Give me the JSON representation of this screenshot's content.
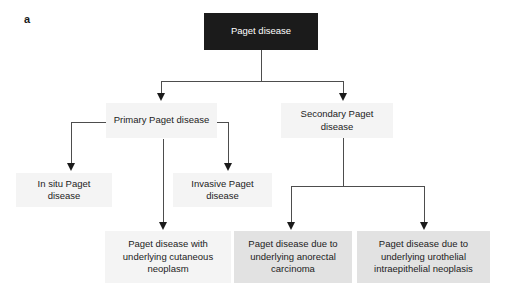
{
  "figure": {
    "panel_label": "a",
    "background_color": "#ffffff"
  },
  "colors": {
    "root_box": "#1b1b1b",
    "root_text": "#ffffff",
    "light_box": "#f4f4f4",
    "mid_box": "#e2e2e2",
    "text": "#1c1c1c",
    "connector": "#4d4d4d",
    "arrowhead": "#1b1b1b"
  },
  "nodes": {
    "root": {
      "label": "Paget disease",
      "style": "dark"
    },
    "primary": {
      "label": "Primary Paget disease",
      "style": "light"
    },
    "secondary": {
      "label": "Secondary Paget disease",
      "style": "light"
    },
    "in_situ": {
      "label": "In situ Paget disease",
      "style": "light"
    },
    "invasive": {
      "label": "Invasive Paget disease",
      "style": "light"
    },
    "cutaneous": {
      "label": "Paget disease with underlying cutaneous neoplasm",
      "style": "light"
    },
    "anorectal": {
      "label": "Paget disease due to underlying anorectal carcinoma",
      "style": "mid"
    },
    "urothelial": {
      "label": "Paget disease due to underlying urothelial intraepithelial neoplasis",
      "style": "mid"
    }
  }
}
